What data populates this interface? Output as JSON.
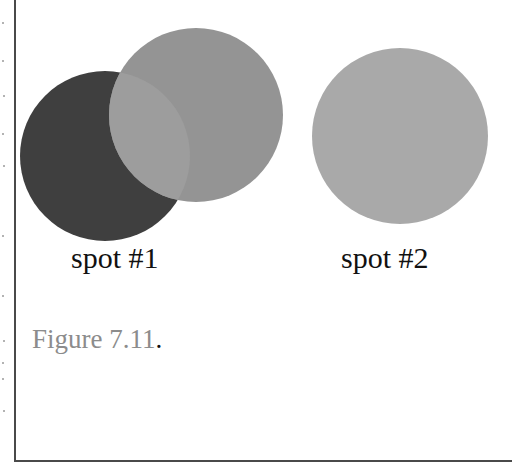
{
  "figure": {
    "caption": "Figure 7.11",
    "caption_period": ".",
    "caption_color": "#8c8c8c"
  },
  "spots": [
    {
      "label": "spot #1",
      "circles": [
        {
          "name": "dark-circle",
          "cx": 105,
          "cy": 156,
          "r": 85,
          "color": "#3f3f3f"
        },
        {
          "name": "medium-circle",
          "cx": 196,
          "cy": 115,
          "r": 87,
          "color": "#949494"
        }
      ],
      "overlap_color": "#9d9d9d"
    },
    {
      "label": "spot #2",
      "circles": [
        {
          "name": "light-circle",
          "cx": 400,
          "cy": 136,
          "r": 88,
          "color": "#a9a9a9"
        }
      ]
    }
  ]
}
